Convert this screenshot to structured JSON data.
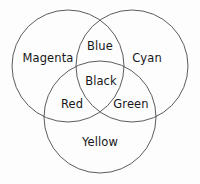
{
  "diagram": {
    "type": "venn-3-set",
    "title": "",
    "background_color": "#fdfdfd",
    "stroke_color": "#4a4a4a",
    "text_color": "#17171a",
    "circles": [
      {
        "name": "magenta-circle",
        "cx": 68,
        "cy": 66,
        "r": 56
      },
      {
        "name": "cyan-circle",
        "cx": 132,
        "cy": 66,
        "r": 56
      },
      {
        "name": "yellow-circle",
        "cx": 100,
        "cy": 117,
        "r": 56
      }
    ],
    "labels": {
      "magenta": "Magenta",
      "cyan": "Cyan",
      "yellow": "Yellow",
      "blue": "Blue",
      "red": "Red",
      "green": "Green",
      "black": "Black"
    },
    "label_positions": {
      "magenta": {
        "x": 48,
        "y": 59
      },
      "cyan": {
        "x": 147,
        "y": 59
      },
      "yellow": {
        "x": 100,
        "y": 143
      },
      "blue": {
        "x": 100,
        "y": 47
      },
      "red": {
        "x": 72,
        "y": 105
      },
      "green": {
        "x": 131,
        "y": 105
      },
      "black": {
        "x": 101,
        "y": 82
      }
    }
  }
}
